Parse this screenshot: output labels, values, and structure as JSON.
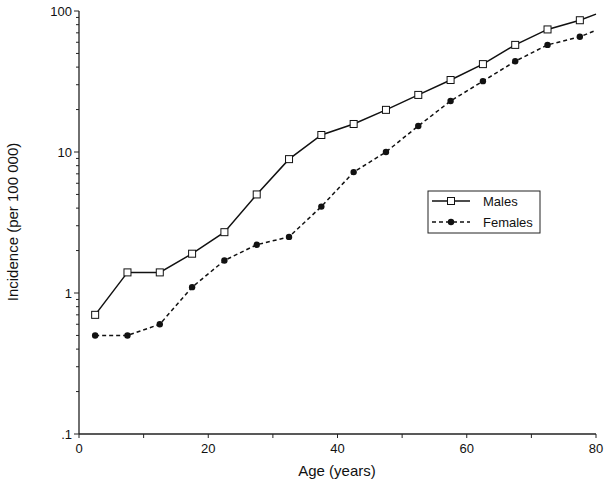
{
  "chart_data": {
    "type": "line",
    "title": "",
    "xlabel": "Age (years)",
    "ylabel": "Incidence (per 100 000)",
    "xlim": [
      0,
      80
    ],
    "ylim": [
      0.1,
      100
    ],
    "yscale": "log",
    "grid": false,
    "legend_position": "center-right",
    "x_ticks": [
      0,
      20,
      40,
      60,
      80
    ],
    "x_tick_labels": [
      "0",
      "20",
      "40",
      "60",
      "80"
    ],
    "y_ticks": [
      0.1,
      1,
      10,
      100
    ],
    "y_tick_labels": [
      ".1",
      "1",
      "10",
      "100"
    ],
    "x": [
      2.5,
      7.5,
      12.5,
      17.5,
      22.5,
      27.5,
      32.5,
      37.5,
      42.5,
      47.5,
      52.5,
      57.5,
      62.5,
      67.5,
      72.5,
      77.5
    ],
    "series": [
      {
        "name": "Males",
        "style": "solid",
        "marker": "open-square",
        "values": [
          0.7,
          1.4,
          1.4,
          1.9,
          2.7,
          5.0,
          8.9,
          13.2,
          15.8,
          19.9,
          25.4,
          32.4,
          42,
          57.5,
          74,
          86
        ],
        "end_value": 95
      },
      {
        "name": "Females",
        "style": "dashed",
        "marker": "filled-circle",
        "values": [
          0.5,
          0.5,
          0.6,
          1.1,
          1.7,
          2.2,
          2.5,
          4.1,
          7.2,
          10,
          15.3,
          23,
          31.8,
          44,
          57.5,
          65.6
        ],
        "end_value": 73
      }
    ]
  }
}
